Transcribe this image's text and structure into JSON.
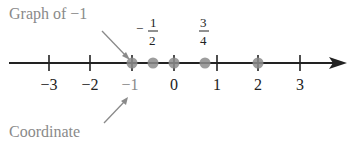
{
  "diagram": {
    "annotations": {
      "graph_label": "Graph of −1",
      "coordinate_label": "Coordinate"
    },
    "axis": {
      "ticks": [
        {
          "value": -3,
          "label": "−3"
        },
        {
          "value": -2,
          "label": "−2"
        },
        {
          "value": -1,
          "label": "−1"
        },
        {
          "value": 0,
          "label": "0"
        },
        {
          "value": 1,
          "label": "1"
        },
        {
          "value": 2,
          "label": "2"
        },
        {
          "value": 3,
          "label": "3"
        }
      ],
      "direction": "right-arrow"
    },
    "points": [
      {
        "value": -1,
        "label": "−1"
      },
      {
        "value": -0.5,
        "label": "−1/2"
      },
      {
        "value": 0,
        "label": "0"
      },
      {
        "value": 0.75,
        "label": "3/4"
      },
      {
        "value": 2,
        "label": "2"
      }
    ],
    "fraction_labels": {
      "neg_half": {
        "sign": "−",
        "num": "1",
        "den": "2"
      },
      "three_quarters": {
        "num": "3",
        "den": "4"
      }
    },
    "colors": {
      "line": "#222222",
      "point": "#8c8c8c",
      "annotation": "#8a8a8a"
    }
  }
}
